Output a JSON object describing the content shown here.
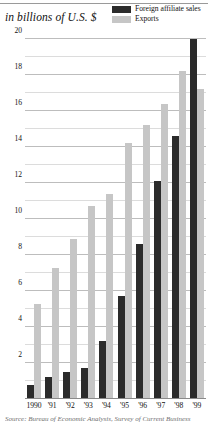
{
  "header": {
    "axis_title": "in billions of U.S. $"
  },
  "legend": {
    "position": "top-right",
    "items": [
      {
        "label": "Foreign affiliate sales",
        "color": "#2b2b2b",
        "key": "foreign-affiliate-sales"
      },
      {
        "label": "Exports",
        "color": "#c6c6c6",
        "key": "exports"
      }
    ]
  },
  "source": {
    "text": "Source: Bureau of Economic Analysis, Survey of Current Business"
  },
  "colors": {
    "foreign_affiliate_sales": "#2b2b2b",
    "exports": "#c6c6c6",
    "gridline_major": "#bdbdbd",
    "gridline_minor": "#dcdcdc",
    "baseline": "#8a8a8a",
    "text": "#111111"
  },
  "chart_data": {
    "type": "bar",
    "title": "in billions of U.S. $",
    "xlabel": "",
    "ylabel": "in billions of U.S. $",
    "categories": [
      "1990",
      "'91",
      "'92",
      "'93",
      "'94",
      "'95",
      "'96",
      "'97",
      "'98",
      "'99"
    ],
    "series": [
      {
        "name": "Foreign affiliate sales",
        "color": "#2b2b2b",
        "values": [
          0.8,
          1.2,
          1.5,
          1.7,
          3.2,
          5.7,
          8.6,
          12.1,
          14.6,
          20.0
        ]
      },
      {
        "name": "Exports",
        "color": "#c6c6c6",
        "values": [
          5.3,
          7.3,
          8.9,
          10.7,
          11.4,
          14.2,
          15.2,
          16.4,
          18.2,
          17.2
        ]
      }
    ],
    "ylim": [
      0,
      20
    ],
    "ytick_labels": [
      "20",
      "18",
      "16",
      "14",
      "12",
      "10",
      "8",
      "6",
      "4",
      "2"
    ],
    "ytick_values": [
      20,
      18,
      16,
      14,
      12,
      10,
      8,
      6,
      4,
      2
    ],
    "gridline_values": [
      20,
      19,
      18,
      17,
      16,
      15,
      14,
      13,
      12,
      11,
      10,
      9,
      8,
      7,
      6,
      5,
      4,
      3,
      2,
      1
    ],
    "grid": true,
    "legend_position": "top-right"
  }
}
